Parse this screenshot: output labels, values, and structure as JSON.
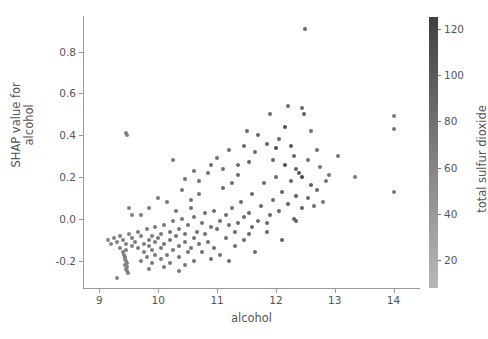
{
  "chart_data": {
    "type": "scatter",
    "title": "",
    "xlabel": "alcohol",
    "ylabel": "SHAP value for\nalcohol",
    "ylabel_line1": "SHAP value for",
    "ylabel_line2": "alcohol",
    "xlim": [
      8.72,
      14.45
    ],
    "ylim": [
      -0.33,
      0.97
    ],
    "xticks": [
      9,
      10,
      11,
      12,
      13,
      14
    ],
    "xticklabels": [
      "9",
      "10",
      "11",
      "12",
      "13",
      "14"
    ],
    "yticks": [
      -0.2,
      0.0,
      0.2,
      0.4,
      0.6,
      0.8
    ],
    "yticklabels": [
      "-0.2",
      "0.0",
      "0.2",
      "0.4",
      "0.6",
      "0.8"
    ],
    "grid": false,
    "legend": null,
    "colorbar": {
      "label": "total sulfur dioxide",
      "ticks": [
        20,
        40,
        60,
        80,
        100,
        120
      ],
      "ticklabels": [
        "20",
        "40",
        "60",
        "80",
        "100",
        "120"
      ],
      "vmin": 8,
      "vmax": 125,
      "orientation": "vertical",
      "position": "right",
      "colormap_low": "#b6b6b6",
      "colormap_high": "#3f3f3f"
    },
    "marker": "circle",
    "marker_size": 4,
    "point_color": "#4d4d4d",
    "points": [
      {
        "x": 12.5,
        "y": 0.91,
        "c": 62
      },
      {
        "x": 14.0,
        "y": 0.49,
        "c": 40
      },
      {
        "x": 12.2,
        "y": 0.54,
        "c": 60
      },
      {
        "x": 12.45,
        "y": 0.53,
        "c": 58
      },
      {
        "x": 12.48,
        "y": 0.5,
        "c": 72
      },
      {
        "x": 11.9,
        "y": 0.5,
        "c": 55
      },
      {
        "x": 14.0,
        "y": 0.43,
        "c": 45
      },
      {
        "x": 12.15,
        "y": 0.44,
        "c": 92
      },
      {
        "x": 12.6,
        "y": 0.42,
        "c": 50
      },
      {
        "x": 11.5,
        "y": 0.42,
        "c": 58
      },
      {
        "x": 11.7,
        "y": 0.4,
        "c": 66
      },
      {
        "x": 12.05,
        "y": 0.38,
        "c": 62
      },
      {
        "x": 11.85,
        "y": 0.36,
        "c": 70
      },
      {
        "x": 11.45,
        "y": 0.35,
        "c": 60
      },
      {
        "x": 12.0,
        "y": 0.34,
        "c": 95
      },
      {
        "x": 11.2,
        "y": 0.33,
        "c": 54
      },
      {
        "x": 11.65,
        "y": 0.32,
        "c": 58
      },
      {
        "x": 12.3,
        "y": 0.3,
        "c": 64
      },
      {
        "x": 11.0,
        "y": 0.29,
        "c": 50
      },
      {
        "x": 12.55,
        "y": 0.28,
        "c": 55
      },
      {
        "x": 11.55,
        "y": 0.27,
        "c": 68
      },
      {
        "x": 12.75,
        "y": 0.25,
        "c": 48
      },
      {
        "x": 10.9,
        "y": 0.26,
        "c": 52
      },
      {
        "x": 12.35,
        "y": 0.24,
        "c": 70
      },
      {
        "x": 12.4,
        "y": 0.22,
        "c": 84
      },
      {
        "x": 12.45,
        "y": 0.2,
        "c": 100
      },
      {
        "x": 11.35,
        "y": 0.21,
        "c": 56
      },
      {
        "x": 12.0,
        "y": 0.2,
        "c": 62
      },
      {
        "x": 12.9,
        "y": 0.21,
        "c": 44
      },
      {
        "x": 13.35,
        "y": 0.2,
        "c": 40
      },
      {
        "x": 12.25,
        "y": 0.18,
        "c": 68
      },
      {
        "x": 11.8,
        "y": 0.17,
        "c": 60
      },
      {
        "x": 12.6,
        "y": 0.16,
        "c": 72
      },
      {
        "x": 14.0,
        "y": 0.13,
        "c": 42
      },
      {
        "x": 12.7,
        "y": 0.14,
        "c": 58
      },
      {
        "x": 11.1,
        "y": 0.15,
        "c": 54
      },
      {
        "x": 12.1,
        "y": 0.13,
        "c": 66
      },
      {
        "x": 11.6,
        "y": 0.12,
        "c": 60
      },
      {
        "x": 12.35,
        "y": 0.11,
        "c": 78
      },
      {
        "x": 10.7,
        "y": 0.12,
        "c": 50
      },
      {
        "x": 12.55,
        "y": 0.1,
        "c": 62
      },
      {
        "x": 11.95,
        "y": 0.09,
        "c": 58
      },
      {
        "x": 12.8,
        "y": 0.08,
        "c": 46
      },
      {
        "x": 11.4,
        "y": 0.08,
        "c": 62
      },
      {
        "x": 12.2,
        "y": 0.07,
        "c": 70
      },
      {
        "x": 10.55,
        "y": 0.09,
        "c": 48
      },
      {
        "x": 11.75,
        "y": 0.06,
        "c": 60
      },
      {
        "x": 12.45,
        "y": 0.05,
        "c": 66
      },
      {
        "x": 11.25,
        "y": 0.05,
        "c": 56
      },
      {
        "x": 10.95,
        "y": 0.04,
        "c": 52
      },
      {
        "x": 12.05,
        "y": 0.04,
        "c": 64
      },
      {
        "x": 11.55,
        "y": 0.03,
        "c": 58
      },
      {
        "x": 10.8,
        "y": 0.03,
        "c": 50
      },
      {
        "x": 11.9,
        "y": 0.02,
        "c": 62
      },
      {
        "x": 11.15,
        "y": 0.02,
        "c": 55
      },
      {
        "x": 10.6,
        "y": 0.01,
        "c": 48
      },
      {
        "x": 11.45,
        "y": 0.01,
        "c": 60
      },
      {
        "x": 12.3,
        "y": 0.0,
        "c": 68
      },
      {
        "x": 10.4,
        "y": 0.0,
        "c": 46
      },
      {
        "x": 11.7,
        "y": -0.01,
        "c": 58
      },
      {
        "x": 11.05,
        "y": -0.01,
        "c": 54
      },
      {
        "x": 10.25,
        "y": -0.01,
        "c": 44
      },
      {
        "x": 11.35,
        "y": -0.02,
        "c": 56
      },
      {
        "x": 10.75,
        "y": -0.02,
        "c": 50
      },
      {
        "x": 11.85,
        "y": -0.02,
        "c": 60
      },
      {
        "x": 10.1,
        "y": -0.03,
        "c": 42
      },
      {
        "x": 11.2,
        "y": -0.03,
        "c": 55
      },
      {
        "x": 10.5,
        "y": -0.03,
        "c": 48
      },
      {
        "x": 11.6,
        "y": -0.04,
        "c": 58
      },
      {
        "x": 9.95,
        "y": -0.04,
        "c": 40
      },
      {
        "x": 10.9,
        "y": -0.04,
        "c": 52
      },
      {
        "x": 10.35,
        "y": -0.05,
        "c": 46
      },
      {
        "x": 11.0,
        "y": -0.05,
        "c": 54
      },
      {
        "x": 9.8,
        "y": -0.05,
        "c": 38
      },
      {
        "x": 10.65,
        "y": -0.06,
        "c": 50
      },
      {
        "x": 10.2,
        "y": -0.06,
        "c": 44
      },
      {
        "x": 11.3,
        "y": -0.06,
        "c": 56
      },
      {
        "x": 9.65,
        "y": -0.06,
        "c": 36
      },
      {
        "x": 10.05,
        "y": -0.07,
        "c": 42
      },
      {
        "x": 10.45,
        "y": -0.07,
        "c": 48
      },
      {
        "x": 9.5,
        "y": -0.07,
        "c": 34
      },
      {
        "x": 10.8,
        "y": -0.07,
        "c": 50
      },
      {
        "x": 9.9,
        "y": -0.08,
        "c": 40
      },
      {
        "x": 9.35,
        "y": -0.08,
        "c": 32
      },
      {
        "x": 10.3,
        "y": -0.08,
        "c": 46
      },
      {
        "x": 9.7,
        "y": -0.08,
        "c": 38
      },
      {
        "x": 10.6,
        "y": -0.09,
        "c": 50
      },
      {
        "x": 9.25,
        "y": -0.09,
        "c": 30
      },
      {
        "x": 9.55,
        "y": -0.09,
        "c": 36
      },
      {
        "x": 10.0,
        "y": -0.09,
        "c": 42
      },
      {
        "x": 9.4,
        "y": -0.1,
        "c": 34
      },
      {
        "x": 9.85,
        "y": -0.1,
        "c": 40
      },
      {
        "x": 10.2,
        "y": -0.1,
        "c": 44
      },
      {
        "x": 9.15,
        "y": -0.1,
        "c": 28
      },
      {
        "x": 9.6,
        "y": -0.11,
        "c": 36
      },
      {
        "x": 10.45,
        "y": -0.11,
        "c": 48
      },
      {
        "x": 9.3,
        "y": -0.11,
        "c": 32
      },
      {
        "x": 9.95,
        "y": -0.11,
        "c": 41
      },
      {
        "x": 9.45,
        "y": -0.12,
        "c": 34
      },
      {
        "x": 9.75,
        "y": -0.12,
        "c": 38
      },
      {
        "x": 10.1,
        "y": -0.12,
        "c": 43
      },
      {
        "x": 9.2,
        "y": -0.12,
        "c": 29
      },
      {
        "x": 10.35,
        "y": -0.13,
        "c": 46
      },
      {
        "x": 9.55,
        "y": -0.13,
        "c": 35
      },
      {
        "x": 9.85,
        "y": -0.13,
        "c": 39
      },
      {
        "x": 9.35,
        "y": -0.14,
        "c": 33
      },
      {
        "x": 10.55,
        "y": -0.14,
        "c": 49
      },
      {
        "x": 9.65,
        "y": -0.14,
        "c": 37
      },
      {
        "x": 10.05,
        "y": -0.14,
        "c": 42
      },
      {
        "x": 9.45,
        "y": -0.15,
        "c": 34
      },
      {
        "x": 9.9,
        "y": -0.15,
        "c": 40
      },
      {
        "x": 10.25,
        "y": -0.15,
        "c": 45
      },
      {
        "x": 9.4,
        "y": -0.16,
        "c": 33
      },
      {
        "x": 9.75,
        "y": -0.16,
        "c": 38
      },
      {
        "x": 10.5,
        "y": -0.16,
        "c": 48
      },
      {
        "x": 9.42,
        "y": -0.17,
        "c": 34
      },
      {
        "x": 10.15,
        "y": -0.17,
        "c": 44
      },
      {
        "x": 9.95,
        "y": -0.17,
        "c": 41
      },
      {
        "x": 11.05,
        "y": -0.17,
        "c": 54
      },
      {
        "x": 9.44,
        "y": -0.18,
        "c": 35
      },
      {
        "x": 10.35,
        "y": -0.18,
        "c": 46
      },
      {
        "x": 9.8,
        "y": -0.18,
        "c": 39
      },
      {
        "x": 10.9,
        "y": -0.19,
        "c": 52
      },
      {
        "x": 9.43,
        "y": -0.19,
        "c": 34
      },
      {
        "x": 10.05,
        "y": -0.19,
        "c": 42
      },
      {
        "x": 11.2,
        "y": -0.2,
        "c": 55
      },
      {
        "x": 9.45,
        "y": -0.2,
        "c": 34
      },
      {
        "x": 9.7,
        "y": -0.2,
        "c": 37
      },
      {
        "x": 10.6,
        "y": -0.2,
        "c": 50
      },
      {
        "x": 9.46,
        "y": -0.21,
        "c": 35
      },
      {
        "x": 10.2,
        "y": -0.21,
        "c": 44
      },
      {
        "x": 9.9,
        "y": -0.21,
        "c": 40
      },
      {
        "x": 9.44,
        "y": -0.22,
        "c": 34
      },
      {
        "x": 10.45,
        "y": -0.22,
        "c": 47
      },
      {
        "x": 9.47,
        "y": -0.23,
        "c": 35
      },
      {
        "x": 10.1,
        "y": -0.23,
        "c": 43
      },
      {
        "x": 9.45,
        "y": -0.24,
        "c": 34
      },
      {
        "x": 9.85,
        "y": -0.24,
        "c": 39
      },
      {
        "x": 10.35,
        "y": -0.25,
        "c": 46
      },
      {
        "x": 9.46,
        "y": -0.25,
        "c": 35
      },
      {
        "x": 9.48,
        "y": -0.26,
        "c": 34
      },
      {
        "x": 9.3,
        "y": -0.28,
        "c": 31
      },
      {
        "x": 10.7,
        "y": -0.12,
        "c": 50
      },
      {
        "x": 10.75,
        "y": -0.16,
        "c": 51
      },
      {
        "x": 11.15,
        "y": -0.09,
        "c": 54
      },
      {
        "x": 11.3,
        "y": -0.13,
        "c": 56
      },
      {
        "x": 10.85,
        "y": -0.11,
        "c": 52
      },
      {
        "x": 11.45,
        "y": -0.1,
        "c": 58
      },
      {
        "x": 10.95,
        "y": -0.14,
        "c": 53
      },
      {
        "x": 11.55,
        "y": -0.07,
        "c": 59
      },
      {
        "x": 10.55,
        "y": 0.05,
        "c": 48
      },
      {
        "x": 10.3,
        "y": 0.04,
        "c": 45
      },
      {
        "x": 10.15,
        "y": 0.08,
        "c": 43
      },
      {
        "x": 9.85,
        "y": 0.05,
        "c": 39
      },
      {
        "x": 10.0,
        "y": 0.1,
        "c": 41
      },
      {
        "x": 10.4,
        "y": 0.14,
        "c": 47
      },
      {
        "x": 9.7,
        "y": 0.02,
        "c": 37
      },
      {
        "x": 10.7,
        "y": 0.18,
        "c": 50
      },
      {
        "x": 10.85,
        "y": 0.22,
        "c": 52
      },
      {
        "x": 9.55,
        "y": 0.02,
        "c": 35
      },
      {
        "x": 10.25,
        "y": 0.28,
        "c": 45
      },
      {
        "x": 9.5,
        "y": 0.05,
        "c": 34
      },
      {
        "x": 10.6,
        "y": 0.23,
        "c": 49
      },
      {
        "x": 11.1,
        "y": 0.24,
        "c": 53
      },
      {
        "x": 11.35,
        "y": 0.26,
        "c": 57
      },
      {
        "x": 9.45,
        "y": 0.41,
        "c": 34
      },
      {
        "x": 9.47,
        "y": 0.4,
        "c": 36
      },
      {
        "x": 11.25,
        "y": 0.17,
        "c": 55
      },
      {
        "x": 10.45,
        "y": 0.19,
        "c": 47
      },
      {
        "x": 12.15,
        "y": 0.26,
        "c": 90
      },
      {
        "x": 12.25,
        "y": 0.35,
        "c": 76
      },
      {
        "x": 11.95,
        "y": 0.28,
        "c": 64
      },
      {
        "x": 12.7,
        "y": 0.33,
        "c": 52
      },
      {
        "x": 13.05,
        "y": 0.3,
        "c": 44
      },
      {
        "x": 12.85,
        "y": 0.18,
        "c": 48
      },
      {
        "x": 12.65,
        "y": 0.06,
        "c": 54
      },
      {
        "x": 12.35,
        "y": -0.01,
        "c": 68
      },
      {
        "x": 11.85,
        "y": -0.06,
        "c": 61
      },
      {
        "x": 11.65,
        "y": -0.16,
        "c": 59
      },
      {
        "x": 12.1,
        "y": -0.1,
        "c": 65
      }
    ]
  }
}
